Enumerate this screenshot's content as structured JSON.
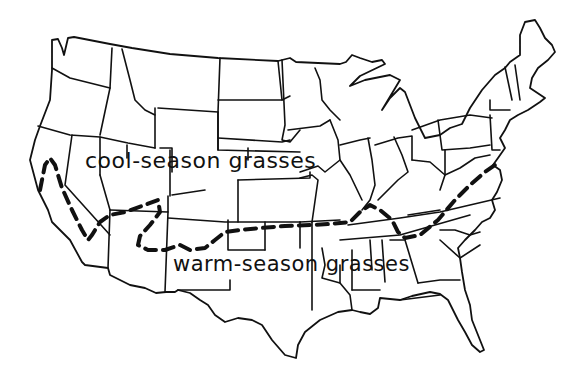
{
  "map": {
    "subject": "Contiguous United States",
    "style": "hand-drawn line map",
    "colors": {
      "background": "#ffffff",
      "ink": "#111111"
    },
    "labels": {
      "north": "cool-season grasses",
      "south": "warm-season grasses"
    },
    "divider": {
      "style": "dashed",
      "description": "boundary between cool-season and warm-season grass zones, from California coast east to Virginia/Maryland"
    }
  }
}
